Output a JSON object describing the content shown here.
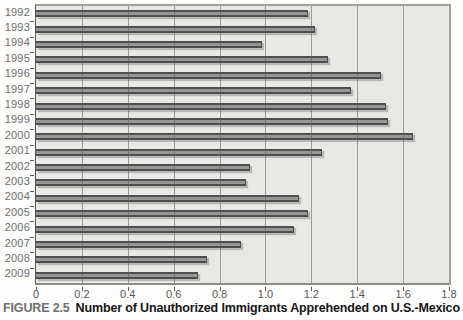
{
  "figure": {
    "label": "FIGURE 2.5",
    "caption": "Number of Unauthorized Immigrants Apprehended on U.S.-Mexico"
  },
  "chart_data": {
    "type": "bar",
    "orientation": "horizontal",
    "title": "",
    "xlabel": "",
    "ylabel": "",
    "categories": [
      "1992",
      "1993",
      "1994",
      "1995",
      "1996",
      "1997",
      "1998",
      "1999",
      "2000",
      "2001",
      "2002",
      "2003",
      "2004",
      "2005",
      "2006",
      "2007",
      "2008",
      "2009"
    ],
    "values": [
      1.18,
      1.21,
      0.98,
      1.27,
      1.5,
      1.37,
      1.52,
      1.53,
      1.64,
      1.24,
      0.93,
      0.91,
      1.14,
      1.18,
      1.12,
      0.89,
      0.74,
      0.7
    ],
    "xlim": [
      0,
      1.8
    ],
    "x_ticks": [
      0,
      0.2,
      0.4,
      0.6,
      0.8,
      1.0,
      1.2,
      1.4,
      1.6,
      1.8
    ],
    "x_tick_labels": [
      "0",
      "0.2",
      "0.4",
      "0.6",
      "0.8",
      "1.0",
      "1.2",
      "1.4",
      "1.6",
      "1.8"
    ],
    "grid": true,
    "legend": false,
    "colors": {
      "plot_bg": "#e9e8e4",
      "gridline": "#8f8f8d",
      "frame": "#a0a09d",
      "axis": "#565656",
      "bar_fill": "#969696",
      "bar_edge": "#4f4f4f",
      "year_label_text": "#6e6e6e",
      "tick_label_text": "#575757",
      "figure_label_text": "#6f6f6f",
      "caption_text": "#161616"
    }
  }
}
